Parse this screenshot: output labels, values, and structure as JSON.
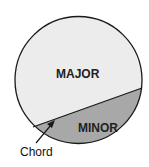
{
  "diagram": {
    "labels": {
      "major": "MAJOR",
      "minor": "MINOR",
      "chord": "Chord"
    },
    "colors": {
      "major_segment": "#ececec",
      "minor_segment": "#a8a8a8",
      "outline": "#1a1a1a"
    }
  }
}
